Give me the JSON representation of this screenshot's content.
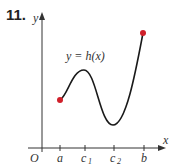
{
  "problem_number": "11.",
  "axes": {
    "x_label": "x",
    "y_label": "y",
    "origin_label": "O"
  },
  "curve_label": "y = h(x)",
  "ticks": [
    {
      "label": "a",
      "sub": ""
    },
    {
      "label": "c",
      "sub": "1"
    },
    {
      "label": "c",
      "sub": "2"
    },
    {
      "label": "b",
      "sub": ""
    }
  ],
  "colors": {
    "curve": "#1a1a1a",
    "endpoint": "#d0202a",
    "axis": "#333333"
  }
}
